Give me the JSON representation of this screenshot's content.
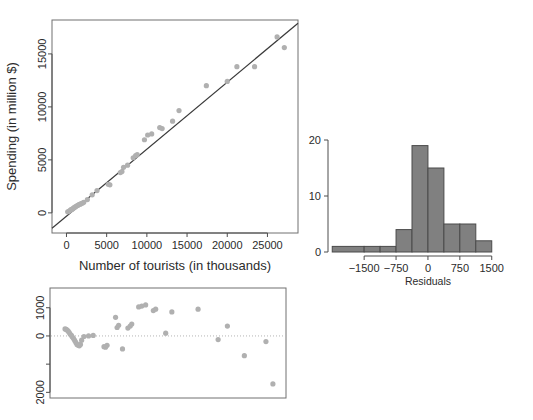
{
  "figure": {
    "background": "#ffffff",
    "point_color": "#b0b0b0",
    "line_color": "#3a3a3a",
    "bar_fill": "#808080",
    "bar_stroke": "#4a4a4a"
  },
  "panels": {
    "scatter": {
      "name": "scatter-plot"
    },
    "histogram": {
      "name": "residual-histogram"
    },
    "residual": {
      "name": "residual-scatter-plot"
    }
  },
  "chart_data": [
    {
      "id": "scatter",
      "type": "scatter",
      "title": "",
      "xlabel": "Number of tourists (in thousands)",
      "ylabel": "Spending (in million $)",
      "xlim": [
        -1800,
        28800
      ],
      "ylim": [
        -1900,
        18200
      ],
      "xticks": [
        0,
        5000,
        10000,
        15000,
        20000,
        25000
      ],
      "yticks": [
        0,
        5000,
        10000,
        15000
      ],
      "xticklabels": [
        "0",
        "5000",
        "10000",
        "15000",
        "20000",
        "25000"
      ],
      "yticklabels": [
        "0",
        "5000",
        "10000",
        "15000"
      ],
      "grid": false,
      "legend": null,
      "fit_line": {
        "label": "least squares regression line",
        "x": [
          -1800,
          28800
        ],
        "y": [
          -1450,
          17900
        ]
      },
      "x": [
        150,
        300,
        420,
        560,
        700,
        830,
        980,
        1100,
        1250,
        1400,
        1550,
        1700,
        1850,
        2000,
        2150,
        2600,
        3200,
        3800,
        5200,
        5400,
        6700,
        6900,
        7100,
        7600,
        8300,
        8600,
        8800,
        9700,
        10100,
        10600,
        11600,
        11900,
        13200,
        14000,
        17400,
        20000,
        21200,
        23400,
        26200,
        27100
      ],
      "y": [
        100,
        150,
        220,
        300,
        350,
        420,
        520,
        560,
        640,
        700,
        780,
        820,
        880,
        930,
        1000,
        1250,
        1700,
        2100,
        2700,
        2650,
        3800,
        3900,
        4300,
        4500,
        5200,
        5400,
        5500,
        6900,
        7350,
        7450,
        8050,
        7950,
        8650,
        9650,
        12000,
        12400,
        13800,
        13800,
        16600,
        15600
      ]
    },
    {
      "id": "histogram",
      "type": "bar",
      "title": "",
      "xlabel": "Residuals",
      "ylabel": "",
      "xlim": [
        -2350,
        1600
      ],
      "ylim": [
        0,
        20
      ],
      "xticks": [
        -1500,
        -750,
        0,
        750,
        1500
      ],
      "yticks": [
        0,
        10,
        20
      ],
      "xticklabels": [
        "−1500",
        "−750",
        "0",
        "750",
        "1500"
      ],
      "yticklabels": [
        "0",
        "10",
        "20"
      ],
      "grid": false,
      "bin_edges": [
        -2250,
        -1875,
        -1500,
        -1125,
        -750,
        -375,
        0,
        375,
        750,
        1125,
        1500
      ],
      "bins": [
        {
          "left": -2250,
          "right": -1500,
          "count": 1
        },
        {
          "left": -1500,
          "right": -1125,
          "count": 1
        },
        {
          "left": -1125,
          "right": -750,
          "count": 1
        },
        {
          "left": -750,
          "right": -375,
          "count": 4
        },
        {
          "left": -375,
          "right": 0,
          "count": 19
        },
        {
          "left": 0,
          "right": 375,
          "count": 15
        },
        {
          "left": 375,
          "right": 750,
          "count": 5
        },
        {
          "left": 750,
          "right": 1125,
          "count": 5
        },
        {
          "left": 1125,
          "right": 1500,
          "count": 2
        }
      ],
      "categories": [
        "-2250 to -1500",
        "-1500 to -1125",
        "-1125 to -750",
        "-750 to -375",
        "-375 to 0",
        "0 to 375",
        "375 to 750",
        "750 to 1125",
        "1125 to 1500"
      ],
      "values": [
        1,
        1,
        1,
        4,
        19,
        15,
        5,
        5,
        2
      ]
    },
    {
      "id": "residual",
      "type": "scatter",
      "title": "",
      "xlabel": "",
      "ylabel": "",
      "xlim": [
        -1800,
        28800
      ],
      "ylim": [
        -2200,
        1700
      ],
      "xticks": [],
      "yticks": [
        1000,
        0,
        -1000,
        -2000
      ],
      "yticklabels": [
        "1000",
        "0",
        "",
        "2000"
      ],
      "grid": false,
      "reference_line": {
        "y": 0,
        "style": "dotted"
      },
      "x": [
        150,
        300,
        420,
        560,
        700,
        830,
        980,
        1100,
        1250,
        1400,
        1550,
        1700,
        1850,
        2000,
        2150,
        2300,
        2600,
        3200,
        3800,
        5200,
        5400,
        5600,
        6700,
        6900,
        7100,
        7600,
        8300,
        8600,
        8800,
        9700,
        10100,
        10600,
        11600,
        11900,
        13200,
        14000,
        17400,
        20000,
        21200,
        23400,
        26200,
        27100
      ],
      "y": [
        250,
        230,
        210,
        170,
        120,
        60,
        20,
        -40,
        -90,
        -160,
        -230,
        -300,
        -330,
        -350,
        -300,
        -150,
        -20,
        0,
        20,
        -380,
        -400,
        -330,
        660,
        300,
        380,
        -460,
        280,
        350,
        420,
        1030,
        1060,
        1100,
        900,
        950,
        100,
        850,
        950,
        -130,
        350,
        -700,
        -200,
        -1700
      ]
    }
  ]
}
